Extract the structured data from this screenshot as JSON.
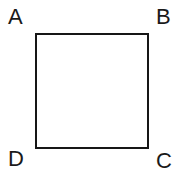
{
  "figure": {
    "kind": "geometry-diagram",
    "background_color": "#ffffff",
    "shape": {
      "name": "square",
      "stroke_color": "#161616",
      "stroke_width": "2",
      "fill_color": "#ffffff"
    },
    "labels": {
      "top_left": "A",
      "top_right": "B",
      "bottom_right": "C",
      "bottom_left": "D"
    },
    "label_color": "#1a1a1a"
  }
}
